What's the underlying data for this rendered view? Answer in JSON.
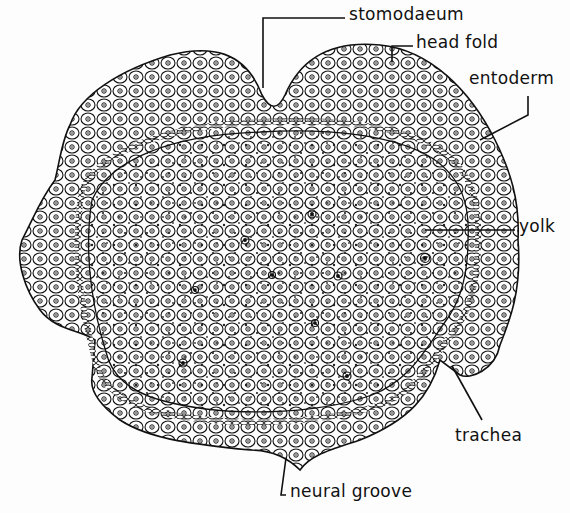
{
  "figure": {
    "labels": [
      {
        "id": "stomodaeum",
        "text": "stomodaeum",
        "x": 349,
        "y": 6
      },
      {
        "id": "head-fold",
        "text": "head fold",
        "x": 416,
        "y": 34
      },
      {
        "id": "entoderm",
        "text": "entoderm",
        "x": 469,
        "y": 70
      },
      {
        "id": "yolk",
        "text": "yolk",
        "x": 519,
        "y": 218
      },
      {
        "id": "trachea",
        "text": "trachea",
        "x": 455,
        "y": 427
      },
      {
        "id": "neural-groove",
        "text": "neural groove",
        "x": 290,
        "y": 483
      }
    ],
    "colors": {
      "ink": "#111111",
      "paper": "#fdfdfd"
    }
  }
}
